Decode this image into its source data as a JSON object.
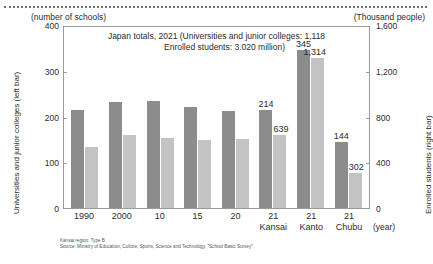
{
  "header": {
    "unit_left": "(number of schools)",
    "unit_right": "(Thousand people)"
  },
  "axis_titles": {
    "left": "Universities and junior colleges (left bar)",
    "right": "Enrolled students (right bar)",
    "x_unit": "(year)"
  },
  "notes": {
    "line1": "Kansai region: Type B",
    "line2": "Source: Ministry of Education, Culture, Sports, Science and Technology, \"School Basic Survey\""
  },
  "chart_data": {
    "type": "bar",
    "title": "Japan totals, 2021  (Universities and junior colleges: 1,118",
    "subtitle": "Enrolled students: 3.020 million)",
    "xlabel": "(year)",
    "ylabel": "Universities and junior colleges (left bar)",
    "y2label": "Enrolled students (right bar)",
    "ylim": [
      0,
      400
    ],
    "y2lim": [
      0,
      1600
    ],
    "yticks": [
      "0",
      "100",
      "200",
      "300",
      "400"
    ],
    "y2ticks": [
      "0",
      "400",
      "800",
      "1,200",
      "1,600"
    ],
    "grid": false,
    "legend": "none",
    "categories": [
      {
        "label": "1990",
        "sub": ""
      },
      {
        "label": "2000",
        "sub": ""
      },
      {
        "label": "10",
        "sub": ""
      },
      {
        "label": "15",
        "sub": ""
      },
      {
        "label": "20",
        "sub": ""
      },
      {
        "label": "21",
        "sub": "Kansai"
      },
      {
        "label": "21",
        "sub": "Kanto"
      },
      {
        "label": "21",
        "sub": "Chubu"
      }
    ],
    "series": [
      {
        "name": "Universities and junior colleges (left bar)",
        "axis": "left",
        "color": "#8c8c8c",
        "values": [
          214,
          232,
          233,
          220,
          211,
          214,
          345,
          144
        ],
        "labels": [
          "",
          "",
          "",
          "",
          "",
          "214",
          "345",
          "144"
        ]
      },
      {
        "name": "Enrolled students (right bar)",
        "axis": "right",
        "color": "#c3c3c3",
        "values": [
          535,
          640,
          608,
          592,
          605,
          639,
          1314,
          302
        ],
        "labels": [
          "",
          "",
          "",
          "",
          "",
          "639",
          "1,314",
          "302"
        ]
      }
    ]
  }
}
